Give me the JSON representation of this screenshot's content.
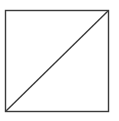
{
  "diagram": {
    "shape": "square-with-diagonal",
    "square": {
      "x": 5.5,
      "y": 10.5,
      "width": 103,
      "height": 101
    },
    "diagonal": {
      "from": "bottom-left",
      "to": "top-right",
      "x1": 5.5,
      "y1": 111.5,
      "x2": 108.5,
      "y2": 10.5
    },
    "stroke_color": "#3a3a3a",
    "background_color": "#ffffff"
  }
}
